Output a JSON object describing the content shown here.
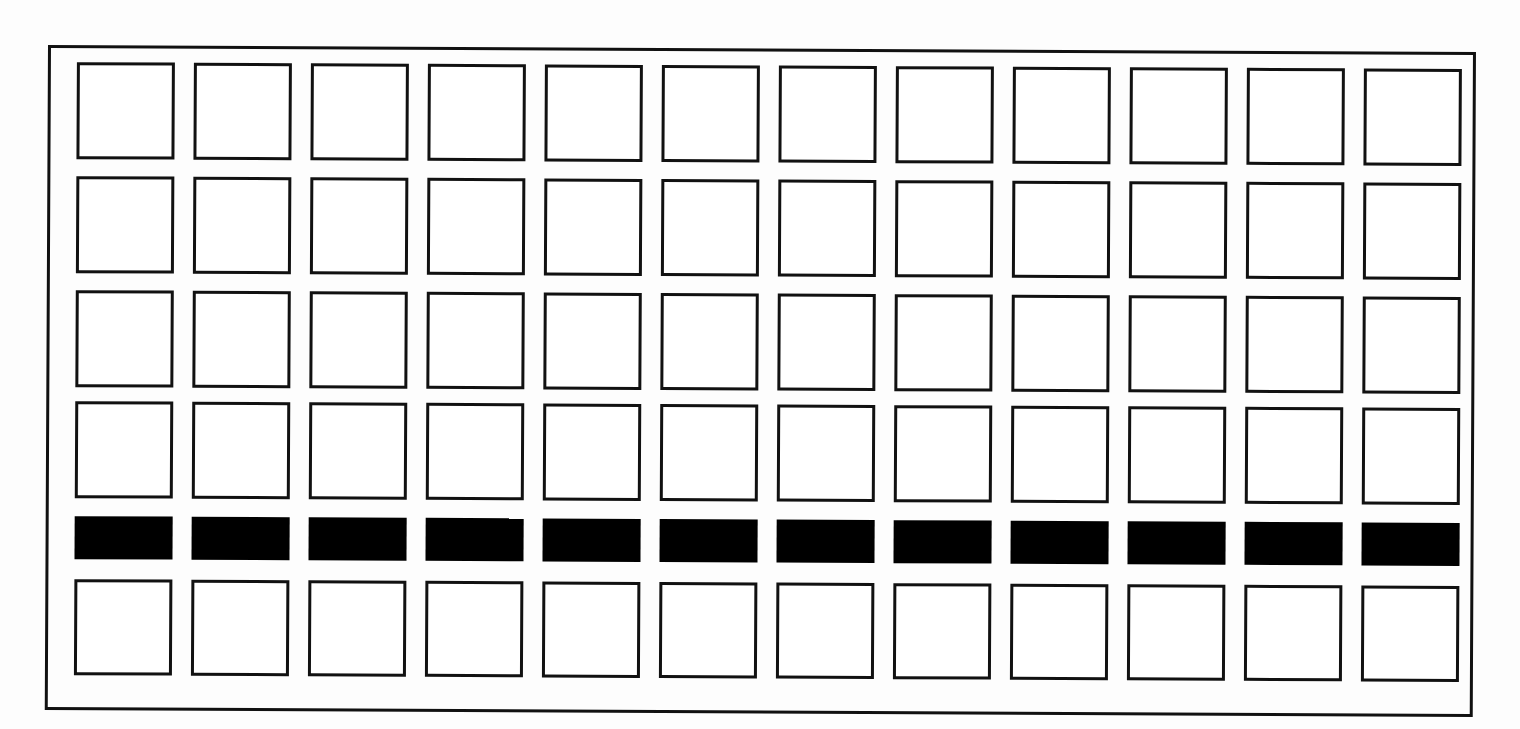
{
  "sheet": {
    "title": "Grid Pattern Sheet",
    "description": "Rectangular outer frame enclosing a 12 column by 6 row grid of cells; rows 1-4 and 6 are empty outlined squares, row 5 is a row of solid black filled short rectangles.",
    "background_color": "#fdfdfd",
    "ink_color": "#111111",
    "fill_color": "#000000",
    "frame": {
      "label": "outer-frame",
      "x": 48,
      "y": 45,
      "width": 1428,
      "height": 665,
      "stroke_width": 3,
      "stroke_color": "#111111",
      "rotation_deg": 0.28
    }
  },
  "grid": {
    "columns": 12,
    "rows": 6,
    "column_pitch": 117,
    "row_pitch": 114,
    "first_column_x": 26,
    "cell_width": 98,
    "row_definitions": [
      {
        "index": 1,
        "label": "row-1",
        "y": 14,
        "height": 97,
        "style": "outline",
        "filled": false
      },
      {
        "index": 2,
        "label": "row-2",
        "y": 128,
        "height": 97,
        "style": "outline",
        "filled": false
      },
      {
        "index": 3,
        "label": "row-3",
        "y": 242,
        "height": 97,
        "style": "outline",
        "filled": false
      },
      {
        "index": 4,
        "label": "row-4",
        "y": 353,
        "height": 97,
        "style": "outline",
        "filled": false
      },
      {
        "index": 5,
        "label": "row-5",
        "y": 468,
        "height": 43,
        "style": "filled",
        "filled": true
      },
      {
        "index": 6,
        "label": "row-6",
        "y": 531,
        "height": 96,
        "style": "outline",
        "filled": false
      }
    ],
    "cell_states": [
      [
        "empty",
        "empty",
        "empty",
        "empty",
        "empty",
        "empty",
        "empty",
        "empty",
        "empty",
        "empty",
        "empty",
        "empty"
      ],
      [
        "empty",
        "empty",
        "empty",
        "empty",
        "empty",
        "empty",
        "empty",
        "empty",
        "empty",
        "empty",
        "empty",
        "empty"
      ],
      [
        "empty",
        "empty",
        "empty",
        "empty",
        "empty",
        "empty",
        "empty",
        "empty",
        "empty",
        "empty",
        "empty",
        "empty"
      ],
      [
        "empty",
        "empty",
        "empty",
        "empty",
        "empty",
        "empty",
        "empty",
        "empty",
        "empty",
        "empty",
        "empty",
        "empty"
      ],
      [
        "filled",
        "filled",
        "filled",
        "filled",
        "filled",
        "filled",
        "filled",
        "filled",
        "filled",
        "filled",
        "filled",
        "filled"
      ],
      [
        "empty",
        "empty",
        "empty",
        "empty",
        "empty",
        "empty",
        "empty",
        "empty",
        "empty",
        "empty",
        "empty",
        "empty"
      ]
    ],
    "column_offsets": [
      26,
      143,
      260,
      377,
      494,
      611,
      728,
      845,
      962,
      1079,
      1196,
      1313
    ]
  }
}
